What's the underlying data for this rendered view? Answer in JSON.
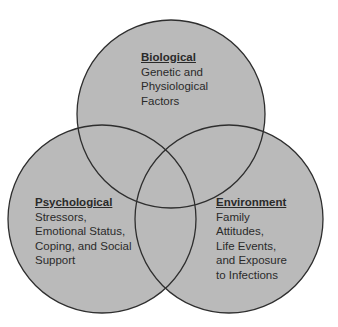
{
  "diagram": {
    "type": "venn",
    "colors": {
      "fill": "#bababa",
      "stroke": "#2e2e2e",
      "text": "#2a2a2a",
      "background": "#ffffff"
    },
    "circles": [
      {
        "id": "biological",
        "title": "Biological",
        "lines": [
          "Genetic and",
          "Physiological",
          "Factors"
        ]
      },
      {
        "id": "psychological",
        "title": "Psychological",
        "lines": [
          "Stressors,",
          "Emotional Status,",
          "Coping, and Social",
          "Support"
        ]
      },
      {
        "id": "environment",
        "title": "Environment",
        "lines": [
          "Family",
          "Attitudes,",
          "Life Events,",
          "and Exposure",
          "to Infections"
        ]
      }
    ]
  }
}
